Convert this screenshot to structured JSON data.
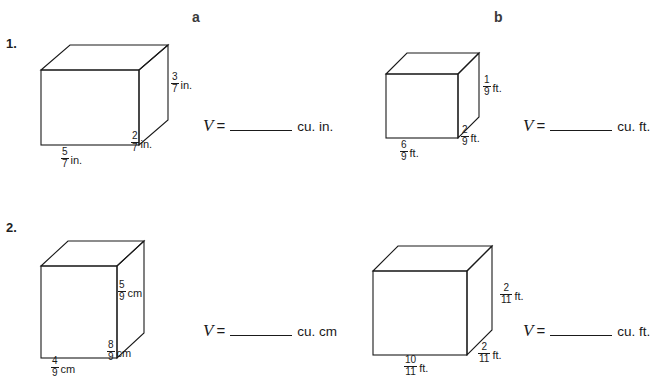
{
  "worksheet": {
    "columns": [
      {
        "id": "a",
        "label": "a"
      },
      {
        "id": "b",
        "label": "b"
      }
    ],
    "problems": [
      {
        "number": "1.",
        "items": [
          {
            "column": "a",
            "shape": "rectangular-prism",
            "dimensions": {
              "width": {
                "numerator": "5",
                "denominator": "7",
                "unit": "in."
              },
              "height": {
                "numerator": "3",
                "denominator": "7",
                "unit": "in."
              },
              "depth": {
                "numerator": "2",
                "denominator": "7",
                "unit": "in."
              }
            },
            "answer": {
              "variable": "V",
              "equals": "=",
              "blank": "",
              "units": "cu. in."
            }
          },
          {
            "column": "b",
            "shape": "rectangular-prism",
            "dimensions": {
              "width": {
                "numerator": "6",
                "denominator": "9",
                "unit": "ft."
              },
              "height": {
                "numerator": "1",
                "denominator": "9",
                "unit": "ft."
              },
              "depth": {
                "numerator": "2",
                "denominator": "9",
                "unit": "ft."
              }
            },
            "answer": {
              "variable": "V",
              "equals": "=",
              "blank": "",
              "units": "cu. ft."
            }
          }
        ]
      },
      {
        "number": "2.",
        "items": [
          {
            "column": "a",
            "shape": "rectangular-prism",
            "dimensions": {
              "width": {
                "numerator": "4",
                "denominator": "9",
                "unit": "cm"
              },
              "height": {
                "numerator": "5",
                "denominator": "9",
                "unit": "cm"
              },
              "depth": {
                "numerator": "8",
                "denominator": "9",
                "unit": "cm"
              }
            },
            "answer": {
              "variable": "V",
              "equals": "=",
              "blank": "",
              "units": "cu. cm"
            }
          },
          {
            "column": "b",
            "shape": "rectangular-prism",
            "dimensions": {
              "width": {
                "numerator": "10",
                "denominator": "11",
                "unit": "ft."
              },
              "height": {
                "numerator": "2",
                "denominator": "11",
                "unit": "ft."
              },
              "depth": {
                "numerator": "2",
                "denominator": "11",
                "unit": "ft."
              }
            },
            "answer": {
              "variable": "V",
              "equals": "=",
              "blank": "",
              "units": "cu. ft."
            }
          }
        ]
      }
    ],
    "colors": {
      "ink": "#1a1a1a",
      "header": "#3a3a3a",
      "background": "#ffffff"
    }
  }
}
